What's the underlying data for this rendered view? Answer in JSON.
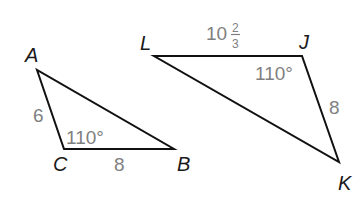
{
  "diagram": {
    "type": "similar-triangles",
    "colors": {
      "edge": "#111111",
      "vertex_label": "#1a1a1a",
      "measure": "#808080",
      "background": "#ffffff"
    },
    "triangle_abc": {
      "vertices": {
        "A": "A",
        "B": "B",
        "C": "C"
      },
      "side_ac": "6",
      "side_cb": "8",
      "angle_c": "110°"
    },
    "triangle_ljk": {
      "vertices": {
        "L": "L",
        "J": "J",
        "K": "K"
      },
      "side_lj_whole": "10",
      "side_lj_num": "2",
      "side_lj_den": "3",
      "side_jk": "8",
      "angle_j": "110°"
    }
  }
}
